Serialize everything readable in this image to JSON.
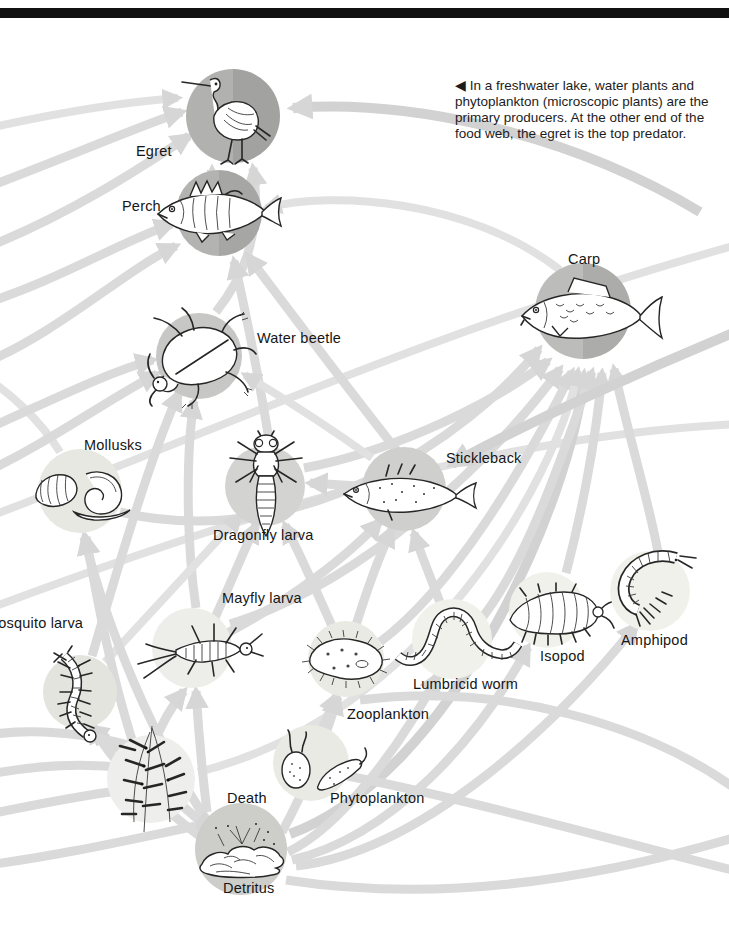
{
  "page": {
    "caption": "◀ In a freshwater lake, water plants and phytoplankton (microscopic plants) are the primary producers. At the other end of the food web, the egret is the top predator."
  },
  "colors": {
    "background": "#ffffff",
    "top_bar": "#111111",
    "arrow": "#dadada",
    "text": "#161616",
    "dark_node_circle": "#a9a9a7",
    "light_node_circle": "#efefe9"
  },
  "organisms": [
    {
      "id": "egret",
      "label": "Egret"
    },
    {
      "id": "perch",
      "label": "Perch"
    },
    {
      "id": "carp",
      "label": "Carp"
    },
    {
      "id": "water-beetle",
      "label": "Water beetle"
    },
    {
      "id": "mollusks",
      "label": "Mollusks"
    },
    {
      "id": "dragonfly-larva",
      "label": "Dragonfly larva"
    },
    {
      "id": "stickleback",
      "label": "Stickleback"
    },
    {
      "id": "mayfly-larva",
      "label": "Mayfly larva"
    },
    {
      "id": "mosquito-larva",
      "label": "Mosquito larva"
    },
    {
      "id": "isopod",
      "label": "Isopod"
    },
    {
      "id": "amphipod",
      "label": "Amphipod"
    },
    {
      "id": "lumbricid-worm",
      "label": "Lumbricid worm"
    },
    {
      "id": "zooplankton",
      "label": "Zooplankton"
    },
    {
      "id": "phytoplankton",
      "label": "Phytoplankton"
    },
    {
      "id": "water-plants",
      "label": ""
    },
    {
      "id": "detritus",
      "label": "Detritus"
    },
    {
      "id": "death",
      "label": "Death"
    }
  ],
  "links": [
    {
      "from": "Perch",
      "to": "Egret"
    },
    {
      "from": "Water beetle",
      "to": "Egret"
    },
    {
      "from": "Carp",
      "to": "Egret"
    },
    {
      "from": "Stickleback",
      "to": "Perch"
    },
    {
      "from": "Dragonfly larva",
      "to": "Perch"
    },
    {
      "from": "Water beetle",
      "to": "Perch"
    },
    {
      "from": "Carp",
      "to": "Perch"
    },
    {
      "from": "Mollusks",
      "to": "Carp"
    },
    {
      "from": "Dragonfly larva",
      "to": "Carp"
    },
    {
      "from": "Mayfly larva",
      "to": "Carp"
    },
    {
      "from": "Zooplankton",
      "to": "Carp"
    },
    {
      "from": "Detritus",
      "to": "Carp"
    },
    {
      "from": "Lumbricid worm",
      "to": "Carp"
    },
    {
      "from": "Isopod",
      "to": "Carp"
    },
    {
      "from": "Amphipod",
      "to": "Carp"
    },
    {
      "from": "Water plants",
      "to": "Carp"
    },
    {
      "from": "Mayfly larva",
      "to": "Water beetle"
    },
    {
      "from": "Mosquito larva",
      "to": "Water beetle"
    },
    {
      "from": "Stickleback",
      "to": "Water beetle"
    },
    {
      "from": "Stickleback",
      "to": "Dragonfly larva"
    },
    {
      "from": "Mayfly larva",
      "to": "Dragonfly larva"
    },
    {
      "from": "Zooplankton",
      "to": "Dragonfly larva"
    },
    {
      "from": "Mosquito larva",
      "to": "Dragonfly larva"
    },
    {
      "from": "Zooplankton",
      "to": "Stickleback"
    },
    {
      "from": "Lumbricid worm",
      "to": "Stickleback"
    },
    {
      "from": "Mayfly larva",
      "to": "Stickleback"
    },
    {
      "from": "Isopod",
      "to": "Stickleback"
    },
    {
      "from": "Water plants",
      "to": "Mollusks"
    },
    {
      "from": "Detritus",
      "to": "Mollusks"
    },
    {
      "from": "Water plants",
      "to": "Mayfly larva"
    },
    {
      "from": "Detritus",
      "to": "Mayfly larva"
    },
    {
      "from": "Water plants",
      "to": "Mosquito larva"
    },
    {
      "from": "Detritus",
      "to": "Mosquito larva"
    },
    {
      "from": "Phytoplankton",
      "to": "Zooplankton"
    },
    {
      "from": "Detritus",
      "to": "Zooplankton"
    },
    {
      "from": "Detritus",
      "to": "Lumbricid worm"
    },
    {
      "from": "Detritus",
      "to": "Isopod"
    },
    {
      "from": "Detritus",
      "to": "Amphipod"
    },
    {
      "from": "Water plants",
      "to": "Detritus"
    },
    {
      "from": "Death",
      "to": "Detritus"
    }
  ]
}
